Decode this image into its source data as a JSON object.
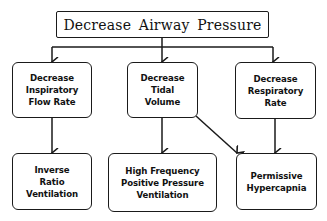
{
  "diagram": {
    "type": "flowchart",
    "root": {
      "label": "Decrease Airway Pressure"
    },
    "level1": [
      {
        "label": "Decrease\nInspiratory\nFlow Rate"
      },
      {
        "label": "Decrease\nTidal\nVolume"
      },
      {
        "label": "Decrease\nRespiratory\nRate"
      }
    ],
    "level2": [
      {
        "label": "Inverse\nRatio\nVentilation"
      },
      {
        "label": "High Frequency\nPositive Pressure\nVentilation"
      },
      {
        "label": "Permissive\nHypercapnia"
      }
    ],
    "edges": [
      {
        "from": "Decrease Airway Pressure",
        "to": "Decrease Inspiratory Flow Rate"
      },
      {
        "from": "Decrease Airway Pressure",
        "to": "Decrease Tidal Volume"
      },
      {
        "from": "Decrease Airway Pressure",
        "to": "Decrease Respiratory Rate"
      },
      {
        "from": "Decrease Inspiratory Flow Rate",
        "to": "Inverse Ratio Ventilation"
      },
      {
        "from": "Decrease Tidal Volume",
        "to": "High Frequency Positive Pressure Ventilation"
      },
      {
        "from": "Decrease Tidal Volume",
        "to": "Permissive Hypercapnia"
      },
      {
        "from": "Decrease Respiratory Rate",
        "to": "Permissive Hypercapnia"
      }
    ],
    "colors": {
      "stroke": "#1a1a1a",
      "background": "#ffffff",
      "text": "#111111"
    }
  }
}
